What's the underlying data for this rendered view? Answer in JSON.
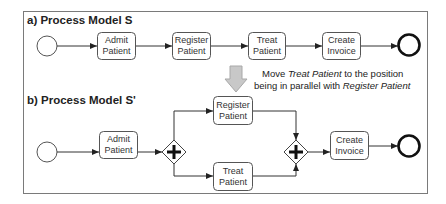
{
  "diagram": {
    "model_a": {
      "title": "a)  Process Model S",
      "tasks": [
        {
          "line1": "Admit",
          "line2": "Patient"
        },
        {
          "line1": "Register",
          "line2": "Patient"
        },
        {
          "line1": "Treat",
          "line2": "Patient"
        },
        {
          "line1": "Create",
          "line2": "Invoice"
        }
      ]
    },
    "transformation": {
      "arrow_icon": "down-arrow-icon",
      "line1_prefix": "Move ",
      "line1_italic": "Treat Patient",
      "line1_suffix": " to the position",
      "line2_prefix": "being in parallel with ",
      "line2_italic": "Register Patient"
    },
    "model_b": {
      "title": "b)  Process Model S'",
      "tasks": [
        {
          "line1": "Admit",
          "line2": "Patient"
        },
        {
          "line1": "Register",
          "line2": "Patient"
        },
        {
          "line1": "Treat",
          "line2": "Patient"
        },
        {
          "line1": "Create",
          "line2": "Invoice"
        }
      ],
      "gateways": [
        "parallel-split",
        "parallel-join"
      ]
    },
    "colors": {
      "arrow_fill": "#c8c8c8",
      "arrow_stroke": "#a8a8a8",
      "frame": "#7a7a7a"
    }
  }
}
